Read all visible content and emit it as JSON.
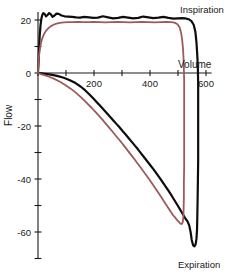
{
  "chart_data": {
    "type": "line",
    "title": "",
    "xlabel": "Volume",
    "ylabel": "Flow",
    "xlim": [
      0,
      620
    ],
    "ylim": [
      -70,
      25
    ],
    "grid": false,
    "legend_position": "none",
    "x_ticks": [
      0,
      100,
      200,
      300,
      400,
      500,
      600
    ],
    "x_tick_labels": [
      "",
      "",
      "200",
      "",
      "400",
      "",
      "600"
    ],
    "y_ticks": [
      20,
      10,
      0,
      -10,
      -20,
      -30,
      -40,
      -50,
      -60,
      -70
    ],
    "y_tick_labels": [
      "20",
      "",
      "0",
      "",
      "-20",
      "",
      "-40",
      "",
      "-60",
      ""
    ],
    "annotations": [
      {
        "text": "Inspiration",
        "x": 560,
        "y": 24
      },
      {
        "text": "Expiration",
        "x": 560,
        "y": -69
      },
      {
        "text": "Volume",
        "x": 615,
        "y": 3
      },
      {
        "text": "Flow",
        "x": -40,
        "y": -16
      }
    ],
    "series": [
      {
        "name": "black-loop",
        "color": "#0d0d0d",
        "width": 2.2,
        "points": [
          [
            0,
            0
          ],
          [
            2,
            4
          ],
          [
            4,
            9
          ],
          [
            6,
            14
          ],
          [
            9,
            18
          ],
          [
            12,
            20.5
          ],
          [
            15,
            21.8
          ],
          [
            19,
            22.6
          ],
          [
            24,
            22.2
          ],
          [
            29,
            21.4
          ],
          [
            34,
            21.9
          ],
          [
            40,
            22.6
          ],
          [
            46,
            22.1
          ],
          [
            52,
            21.2
          ],
          [
            58,
            21.6
          ],
          [
            66,
            22.4
          ],
          [
            74,
            22.3
          ],
          [
            84,
            21.7
          ],
          [
            95,
            21.4
          ],
          [
            108,
            21.3
          ],
          [
            122,
            21.2
          ],
          [
            136,
            21.0
          ],
          [
            150,
            20.9
          ],
          [
            166,
            21.2
          ],
          [
            182,
            21.0
          ],
          [
            198,
            20.8
          ],
          [
            214,
            20.9
          ],
          [
            232,
            21.4
          ],
          [
            250,
            21.0
          ],
          [
            268,
            20.6
          ],
          [
            286,
            20.8
          ],
          [
            304,
            21.2
          ],
          [
            322,
            20.9
          ],
          [
            340,
            20.6
          ],
          [
            358,
            20.8
          ],
          [
            376,
            21.3
          ],
          [
            394,
            21.0
          ],
          [
            412,
            20.7
          ],
          [
            430,
            20.9
          ],
          [
            448,
            21.2
          ],
          [
            466,
            20.8
          ],
          [
            484,
            20.5
          ],
          [
            500,
            20.6
          ],
          [
            514,
            20.7
          ],
          [
            526,
            20.6
          ],
          [
            538,
            20.3
          ],
          [
            548,
            19.6
          ],
          [
            556,
            18.2
          ],
          [
            562,
            15.6
          ],
          [
            566,
            11.5
          ],
          [
            569,
            6.5
          ],
          [
            571,
            1.5
          ],
          [
            572,
            -4.0
          ],
          [
            572,
            -10.0
          ],
          [
            572,
            -17.0
          ],
          [
            572,
            -25.0
          ],
          [
            572,
            -33.0
          ],
          [
            571,
            -41.0
          ],
          [
            570,
            -48.0
          ],
          [
            569,
            -54.0
          ],
          [
            568,
            -59.0
          ],
          [
            566,
            -62.5
          ],
          [
            563,
            -64.6
          ],
          [
            559,
            -65.4
          ],
          [
            554,
            -65.0
          ],
          [
            549,
            -63.0
          ],
          [
            545,
            -60.0
          ],
          [
            540,
            -57.5
          ],
          [
            534,
            -56.0
          ],
          [
            527,
            -55.0
          ],
          [
            519,
            -53.6
          ],
          [
            510,
            -52.0
          ],
          [
            500,
            -50.2
          ],
          [
            489,
            -48.3
          ],
          [
            478,
            -46.4
          ],
          [
            467,
            -44.6
          ],
          [
            456,
            -42.9
          ],
          [
            445,
            -41.2
          ],
          [
            434,
            -39.5
          ],
          [
            423,
            -37.9
          ],
          [
            412,
            -36.3
          ],
          [
            401,
            -34.8
          ],
          [
            390,
            -33.3
          ],
          [
            379,
            -31.8
          ],
          [
            368,
            -30.3
          ],
          [
            357,
            -28.8
          ],
          [
            346,
            -27.4
          ],
          [
            335,
            -26.0
          ],
          [
            324,
            -24.6
          ],
          [
            313,
            -23.2
          ],
          [
            302,
            -21.9
          ],
          [
            291,
            -20.5
          ],
          [
            280,
            -19.2
          ],
          [
            269,
            -17.9
          ],
          [
            258,
            -16.6
          ],
          [
            246,
            -15.2
          ],
          [
            234,
            -13.8
          ],
          [
            222,
            -12.4
          ],
          [
            210,
            -11.0
          ],
          [
            197,
            -9.5
          ],
          [
            183,
            -8.0
          ],
          [
            168,
            -6.5
          ],
          [
            152,
            -5.1
          ],
          [
            134,
            -3.8
          ],
          [
            114,
            -2.7
          ],
          [
            92,
            -1.8
          ],
          [
            68,
            -1.1
          ],
          [
            46,
            -0.6
          ],
          [
            26,
            -0.3
          ],
          [
            12,
            -0.1
          ],
          [
            4,
            0
          ],
          [
            0,
            0
          ]
        ]
      },
      {
        "name": "maroon-loop",
        "color": "#9e5a5a",
        "width": 1.8,
        "points": [
          [
            0,
            0
          ],
          [
            1,
            3
          ],
          [
            3,
            6
          ],
          [
            6,
            8.5
          ],
          [
            10,
            11
          ],
          [
            15,
            13
          ],
          [
            21,
            14.6
          ],
          [
            28,
            15.8
          ],
          [
            36,
            16.8
          ],
          [
            45,
            17.6
          ],
          [
            55,
            18.2
          ],
          [
            66,
            18.6
          ],
          [
            78,
            18.9
          ],
          [
            92,
            19.1
          ],
          [
            108,
            19.2
          ],
          [
            124,
            19.2
          ],
          [
            142,
            19.3
          ],
          [
            160,
            19.2
          ],
          [
            180,
            19.2
          ],
          [
            200,
            19.3
          ],
          [
            220,
            19.2
          ],
          [
            240,
            19.1
          ],
          [
            262,
            19.2
          ],
          [
            284,
            19.3
          ],
          [
            306,
            19.2
          ],
          [
            328,
            19.1
          ],
          [
            350,
            19.2
          ],
          [
            372,
            19.3
          ],
          [
            394,
            19.2
          ],
          [
            416,
            19.1
          ],
          [
            438,
            19.2
          ],
          [
            458,
            19.3
          ],
          [
            474,
            19.2
          ],
          [
            488,
            19.0
          ],
          [
            498,
            18.4
          ],
          [
            506,
            17.2
          ],
          [
            511,
            15.2
          ],
          [
            515,
            12.4
          ],
          [
            518,
            9.0
          ],
          [
            520,
            5.2
          ],
          [
            521,
            1.2
          ],
          [
            522,
            -3.0
          ],
          [
            522,
            -8.0
          ],
          [
            522,
            -14.0
          ],
          [
            522,
            -21.0
          ],
          [
            522,
            -28.0
          ],
          [
            522,
            -35.0
          ],
          [
            521,
            -41.5
          ],
          [
            521,
            -47.0
          ],
          [
            520,
            -51.5
          ],
          [
            519,
            -54.5
          ],
          [
            517,
            -56.3
          ],
          [
            513,
            -57.0
          ],
          [
            508,
            -56.8
          ],
          [
            503,
            -56.2
          ],
          [
            497,
            -55.5
          ],
          [
            490,
            -54.6
          ],
          [
            482,
            -53.6
          ],
          [
            473,
            -52.2
          ],
          [
            463,
            -50.6
          ],
          [
            452,
            -48.8
          ],
          [
            441,
            -47.0
          ],
          [
            430,
            -45.2
          ],
          [
            419,
            -43.5
          ],
          [
            408,
            -41.8
          ],
          [
            397,
            -40.1
          ],
          [
            386,
            -38.5
          ],
          [
            375,
            -36.9
          ],
          [
            364,
            -35.3
          ],
          [
            353,
            -33.8
          ],
          [
            342,
            -32.2
          ],
          [
            331,
            -30.7
          ],
          [
            320,
            -29.2
          ],
          [
            309,
            -27.7
          ],
          [
            298,
            -26.2
          ],
          [
            287,
            -24.8
          ],
          [
            276,
            -23.4
          ],
          [
            265,
            -22.0
          ],
          [
            254,
            -20.6
          ],
          [
            242,
            -19.1
          ],
          [
            230,
            -17.6
          ],
          [
            218,
            -16.2
          ],
          [
            206,
            -14.8
          ],
          [
            193,
            -13.3
          ],
          [
            180,
            -11.9
          ],
          [
            166,
            -10.4
          ],
          [
            151,
            -8.9
          ],
          [
            135,
            -7.4
          ],
          [
            118,
            -6.0
          ],
          [
            100,
            -4.7
          ],
          [
            80,
            -3.4
          ],
          [
            60,
            -2.3
          ],
          [
            40,
            -1.4
          ],
          [
            22,
            -0.8
          ],
          [
            10,
            -0.4
          ],
          [
            3,
            -0.1
          ],
          [
            0,
            0
          ]
        ]
      }
    ]
  }
}
